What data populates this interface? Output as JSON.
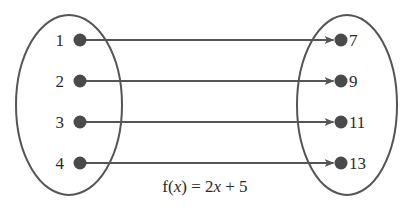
{
  "diagram": {
    "type": "function-mapping",
    "domain_set": {
      "name": "domain",
      "values": [
        "1",
        "2",
        "3",
        "4"
      ]
    },
    "range_set": {
      "name": "range",
      "values": [
        "7",
        "9",
        "11",
        "13"
      ]
    },
    "mappings": [
      {
        "from": "1",
        "to": "7"
      },
      {
        "from": "2",
        "to": "9"
      },
      {
        "from": "3",
        "to": "11"
      },
      {
        "from": "4",
        "to": "13"
      }
    ],
    "formula": {
      "prefix": "f(",
      "variable": "x",
      "middle": ") = 2",
      "variable2": "x",
      "suffix": " + 5",
      "full": "f(x) = 2x + 5"
    },
    "colors": {
      "stroke": "#555555",
      "dot": "#4a4a4a",
      "text": "#2a2a2a"
    }
  }
}
